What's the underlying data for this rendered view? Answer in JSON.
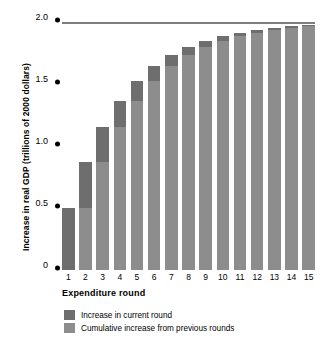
{
  "chart_data": {
    "type": "bar",
    "title": "",
    "xlabel": "Expenditure round",
    "ylabel": "Increase in real GDP (trillions of 2000 dollars)",
    "categories": [
      "1",
      "2",
      "3",
      "4",
      "5",
      "6",
      "7",
      "8",
      "9",
      "10",
      "11",
      "12",
      "13",
      "14",
      "15"
    ],
    "ylim": [
      0,
      2.0
    ],
    "yticks": [
      0,
      0.5,
      1.0,
      1.5,
      2.0
    ],
    "ytick_labels": [
      "0",
      "0.5",
      "1.0",
      "1.5",
      "2.0"
    ],
    "grid": false,
    "legend_position": "bottom-left",
    "reference_line": {
      "value": 2.0,
      "label": "",
      "color": "#7d7d7d"
    },
    "series": [
      {
        "name": "Cumulative increase from previous rounds",
        "color": "#8d8d8d",
        "values": [
          0,
          0.5,
          0.875,
          1.156,
          1.367,
          1.525,
          1.644,
          1.733,
          1.8,
          1.85,
          1.887,
          1.915,
          1.937,
          1.952,
          1.964
        ]
      },
      {
        "name": "Increase in current round",
        "color": "#6e6e6e",
        "values": [
          0.5,
          0.375,
          0.281,
          0.211,
          0.158,
          0.119,
          0.089,
          0.067,
          0.05,
          0.038,
          0.028,
          0.021,
          0.016,
          0.012,
          0.009
        ]
      }
    ],
    "cumulative_totals": [
      0.5,
      0.875,
      1.156,
      1.367,
      1.525,
      1.644,
      1.733,
      1.8,
      1.85,
      1.887,
      1.915,
      1.937,
      1.952,
      1.964,
      1.973
    ]
  },
  "legend": {
    "items": [
      {
        "label": "Increase in current round"
      },
      {
        "label": "Cumulative increase from previous rounds"
      }
    ]
  }
}
